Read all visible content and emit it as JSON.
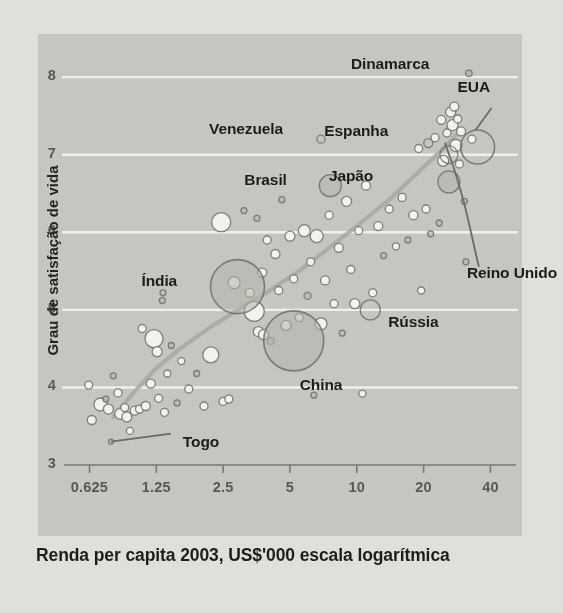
{
  "chart_data": {
    "type": "scatter",
    "title": "",
    "xlabel": "Renda per capita 2003, US$'000 escala logarítmica",
    "ylabel": "Grau de satisfação de vida",
    "xscale": "log",
    "xlim": [
      0.5,
      48
    ],
    "ylim": [
      3,
      8.35
    ],
    "xticks": [
      0.625,
      1.25,
      2.5,
      5,
      10,
      20,
      40
    ],
    "xticklabels": [
      "0.625",
      "1.25",
      "2.5",
      "5",
      "10",
      "20",
      "40"
    ],
    "yticks": [
      3,
      4,
      5,
      6,
      7,
      8
    ],
    "yticklabels": [
      "3",
      "4",
      "5",
      "6",
      "7",
      "8"
    ],
    "grid": "horizontal",
    "legend": "none",
    "bubble_note": "marker area scales with population",
    "colors": {
      "panel_background": "#c8c8c2",
      "figure_background": "#e2e2dc",
      "gridline": "#f2f2ee",
      "marker_edge": "#6f6f69",
      "marker_fill_light": "#f4f4f0",
      "marker_fill_dark": "#b4b4ad",
      "trend_line": "#a8a8a1",
      "leader_line": "#6b6b65",
      "axis_text": "#585854",
      "label_text": "#1c1c19"
    },
    "annotations": [
      {
        "label": "Dinamarca",
        "x": 32,
        "y": 8.05,
        "r": 3.2,
        "fill": "dark",
        "label_dx": -118,
        "label_dy": -9
      },
      {
        "label": "EUA",
        "x": 35,
        "y": 7.1,
        "r": 17,
        "fill": "none",
        "label_dx": -20,
        "label_dy": -60,
        "leader": true
      },
      {
        "label": "Espanha",
        "x": 21,
        "y": 7.15,
        "r": 4.5,
        "fill": "none",
        "label_dx": -104,
        "label_dy": -12
      },
      {
        "label": "Venezuela",
        "x": 6.9,
        "y": 7.2,
        "r": 4,
        "fill": "none",
        "label_dx": -112,
        "label_dy": -10
      },
      {
        "label": "Brasil",
        "x": 7.6,
        "y": 6.6,
        "r": 11,
        "fill": "dark",
        "label_dx": -86,
        "label_dy": -6
      },
      {
        "label": "Japão",
        "x": 26,
        "y": 6.65,
        "r": 11,
        "fill": "dark",
        "label_dx": -120,
        "label_dy": -6
      },
      {
        "label": "Índia",
        "x": 2.9,
        "y": 5.3,
        "r": 27,
        "fill": "dark",
        "label_dx": -96,
        "label_dy": -6
      },
      {
        "label": "Reino Unido",
        "x": 26,
        "y": 7.0,
        "r": 9,
        "fill": "none",
        "label_dx": 18,
        "label_dy": 118,
        "leader": true
      },
      {
        "label": "Rússia",
        "x": 11.5,
        "y": 5.0,
        "r": 10,
        "fill": "none",
        "label_dx": 18,
        "label_dy": 12
      },
      {
        "label": "China",
        "x": 5.2,
        "y": 4.6,
        "r": 30,
        "fill": "dark",
        "label_dx": 6,
        "label_dy": 44
      },
      {
        "label": "Togo",
        "x": 0.78,
        "y": 3.3,
        "r": 2.5,
        "fill": "dark",
        "label_dx": 72,
        "label_dy": 0,
        "leader": true
      }
    ],
    "points": [
      {
        "x": 0.62,
        "y": 4.03,
        "r": 4.0,
        "fill": "light"
      },
      {
        "x": 0.64,
        "y": 3.58,
        "r": 4.5,
        "fill": "light"
      },
      {
        "x": 0.7,
        "y": 3.78,
        "r": 6.5,
        "fill": "light"
      },
      {
        "x": 0.74,
        "y": 3.85,
        "r": 3.0,
        "fill": "dark"
      },
      {
        "x": 0.76,
        "y": 3.72,
        "r": 5.0,
        "fill": "light"
      },
      {
        "x": 0.8,
        "y": 4.15,
        "r": 3.0,
        "fill": "dark"
      },
      {
        "x": 0.84,
        "y": 3.93,
        "r": 4.0,
        "fill": "light"
      },
      {
        "x": 0.86,
        "y": 3.66,
        "r": 5.5,
        "fill": "light"
      },
      {
        "x": 0.9,
        "y": 3.74,
        "r": 4.0,
        "fill": "light"
      },
      {
        "x": 0.92,
        "y": 3.62,
        "r": 5.0,
        "fill": "light"
      },
      {
        "x": 0.95,
        "y": 3.44,
        "r": 3.5,
        "fill": "light"
      },
      {
        "x": 1.0,
        "y": 3.7,
        "r": 4.5,
        "fill": "light"
      },
      {
        "x": 1.05,
        "y": 3.72,
        "r": 4.0,
        "fill": "light"
      },
      {
        "x": 1.08,
        "y": 4.76,
        "r": 4.0,
        "fill": "light"
      },
      {
        "x": 1.12,
        "y": 3.76,
        "r": 4.5,
        "fill": "light"
      },
      {
        "x": 1.18,
        "y": 4.05,
        "r": 4.5,
        "fill": "light"
      },
      {
        "x": 1.22,
        "y": 4.63,
        "r": 9.0,
        "fill": "light"
      },
      {
        "x": 1.26,
        "y": 4.46,
        "r": 5.0,
        "fill": "light"
      },
      {
        "x": 1.28,
        "y": 3.86,
        "r": 4.0,
        "fill": "light"
      },
      {
        "x": 1.33,
        "y": 5.12,
        "r": 3.0,
        "fill": "dark"
      },
      {
        "x": 1.34,
        "y": 5.22,
        "r": 3.0,
        "fill": "dark"
      },
      {
        "x": 1.36,
        "y": 3.68,
        "r": 4.0,
        "fill": "light"
      },
      {
        "x": 1.4,
        "y": 4.18,
        "r": 3.5,
        "fill": "light"
      },
      {
        "x": 1.46,
        "y": 4.54,
        "r": 3.0,
        "fill": "dark"
      },
      {
        "x": 1.55,
        "y": 3.8,
        "r": 3.0,
        "fill": "dark"
      },
      {
        "x": 1.62,
        "y": 4.34,
        "r": 3.5,
        "fill": "light"
      },
      {
        "x": 1.75,
        "y": 3.98,
        "r": 4.0,
        "fill": "light"
      },
      {
        "x": 1.9,
        "y": 4.18,
        "r": 3.0,
        "fill": "dark"
      },
      {
        "x": 2.05,
        "y": 3.76,
        "r": 4.0,
        "fill": "light"
      },
      {
        "x": 2.2,
        "y": 4.42,
        "r": 8.0,
        "fill": "light"
      },
      {
        "x": 2.45,
        "y": 6.13,
        "r": 9.5,
        "fill": "light"
      },
      {
        "x": 2.5,
        "y": 3.82,
        "r": 4.0,
        "fill": "light"
      },
      {
        "x": 2.65,
        "y": 3.85,
        "r": 4.0,
        "fill": "light"
      },
      {
        "x": 2.8,
        "y": 5.35,
        "r": 6.0,
        "fill": "light"
      },
      {
        "x": 3.1,
        "y": 6.28,
        "r": 3.0,
        "fill": "dark"
      },
      {
        "x": 3.3,
        "y": 5.22,
        "r": 4.5,
        "fill": "light"
      },
      {
        "x": 3.45,
        "y": 4.98,
        "r": 10.0,
        "fill": "light"
      },
      {
        "x": 3.55,
        "y": 6.18,
        "r": 3.0,
        "fill": "dark"
      },
      {
        "x": 3.6,
        "y": 4.72,
        "r": 5.0,
        "fill": "light"
      },
      {
        "x": 3.75,
        "y": 5.48,
        "r": 4.5,
        "fill": "light"
      },
      {
        "x": 3.8,
        "y": 4.68,
        "r": 5.0,
        "fill": "light"
      },
      {
        "x": 3.95,
        "y": 5.9,
        "r": 4.0,
        "fill": "light"
      },
      {
        "x": 4.1,
        "y": 4.6,
        "r": 3.5,
        "fill": "dark"
      },
      {
        "x": 4.3,
        "y": 5.72,
        "r": 4.5,
        "fill": "light"
      },
      {
        "x": 4.45,
        "y": 5.25,
        "r": 4.0,
        "fill": "light"
      },
      {
        "x": 4.6,
        "y": 6.42,
        "r": 3.0,
        "fill": "dark"
      },
      {
        "x": 4.8,
        "y": 4.8,
        "r": 5.0,
        "fill": "light"
      },
      {
        "x": 5.0,
        "y": 5.95,
        "r": 5.0,
        "fill": "light"
      },
      {
        "x": 5.2,
        "y": 5.4,
        "r": 4.0,
        "fill": "light"
      },
      {
        "x": 5.5,
        "y": 4.9,
        "r": 4.0,
        "fill": "light"
      },
      {
        "x": 5.8,
        "y": 6.02,
        "r": 6.0,
        "fill": "light"
      },
      {
        "x": 6.0,
        "y": 5.18,
        "r": 3.5,
        "fill": "dark"
      },
      {
        "x": 6.2,
        "y": 5.62,
        "r": 4.0,
        "fill": "light"
      },
      {
        "x": 6.4,
        "y": 3.9,
        "r": 3.0,
        "fill": "dark"
      },
      {
        "x": 6.6,
        "y": 5.95,
        "r": 6.5,
        "fill": "light"
      },
      {
        "x": 6.9,
        "y": 4.82,
        "r": 6.0,
        "fill": "light"
      },
      {
        "x": 7.2,
        "y": 5.38,
        "r": 4.5,
        "fill": "light"
      },
      {
        "x": 7.5,
        "y": 6.22,
        "r": 4.0,
        "fill": "light"
      },
      {
        "x": 7.9,
        "y": 5.08,
        "r": 4.0,
        "fill": "light"
      },
      {
        "x": 8.3,
        "y": 5.8,
        "r": 4.5,
        "fill": "light"
      },
      {
        "x": 8.6,
        "y": 4.7,
        "r": 3.0,
        "fill": "dark"
      },
      {
        "x": 9.0,
        "y": 6.4,
        "r": 5.0,
        "fill": "light"
      },
      {
        "x": 9.4,
        "y": 5.52,
        "r": 4.0,
        "fill": "light"
      },
      {
        "x": 9.8,
        "y": 5.08,
        "r": 5.0,
        "fill": "light"
      },
      {
        "x": 10.2,
        "y": 6.02,
        "r": 4.0,
        "fill": "light"
      },
      {
        "x": 10.6,
        "y": 3.92,
        "r": 3.5,
        "fill": "light"
      },
      {
        "x": 11.0,
        "y": 6.6,
        "r": 4.5,
        "fill": "light"
      },
      {
        "x": 11.8,
        "y": 5.22,
        "r": 4.0,
        "fill": "light"
      },
      {
        "x": 12.5,
        "y": 6.08,
        "r": 4.5,
        "fill": "light"
      },
      {
        "x": 13.2,
        "y": 5.7,
        "r": 3.0,
        "fill": "dark"
      },
      {
        "x": 14.0,
        "y": 6.3,
        "r": 4.0,
        "fill": "light"
      },
      {
        "x": 15.0,
        "y": 5.82,
        "r": 3.5,
        "fill": "light"
      },
      {
        "x": 16.0,
        "y": 6.45,
        "r": 4.0,
        "fill": "light"
      },
      {
        "x": 17.0,
        "y": 5.9,
        "r": 3.0,
        "fill": "dark"
      },
      {
        "x": 18.0,
        "y": 6.22,
        "r": 4.5,
        "fill": "light"
      },
      {
        "x": 19.0,
        "y": 7.08,
        "r": 4.0,
        "fill": "light"
      },
      {
        "x": 19.5,
        "y": 5.25,
        "r": 3.5,
        "fill": "light"
      },
      {
        "x": 20.5,
        "y": 6.3,
        "r": 4.0,
        "fill": "light"
      },
      {
        "x": 21.5,
        "y": 5.98,
        "r": 3.0,
        "fill": "dark"
      },
      {
        "x": 22.5,
        "y": 7.22,
        "r": 4.0,
        "fill": "light"
      },
      {
        "x": 23.5,
        "y": 6.12,
        "r": 3.0,
        "fill": "dark"
      },
      {
        "x": 24.0,
        "y": 7.45,
        "r": 4.5,
        "fill": "light"
      },
      {
        "x": 24.5,
        "y": 6.92,
        "r": 5.5,
        "fill": "light"
      },
      {
        "x": 25.5,
        "y": 7.28,
        "r": 4.0,
        "fill": "light"
      },
      {
        "x": 26.5,
        "y": 7.55,
        "r": 5.0,
        "fill": "light"
      },
      {
        "x": 27.0,
        "y": 7.38,
        "r": 5.5,
        "fill": "light"
      },
      {
        "x": 27.5,
        "y": 7.62,
        "r": 4.5,
        "fill": "light"
      },
      {
        "x": 28.0,
        "y": 7.12,
        "r": 6.0,
        "fill": "light"
      },
      {
        "x": 28.5,
        "y": 7.46,
        "r": 4.0,
        "fill": "light"
      },
      {
        "x": 29.0,
        "y": 6.88,
        "r": 4.0,
        "fill": "light"
      },
      {
        "x": 29.5,
        "y": 7.3,
        "r": 4.5,
        "fill": "light"
      },
      {
        "x": 30.5,
        "y": 6.4,
        "r": 3.0,
        "fill": "dark"
      },
      {
        "x": 31.0,
        "y": 5.62,
        "r": 3.0,
        "fill": "dark"
      },
      {
        "x": 33.0,
        "y": 7.2,
        "r": 4.0,
        "fill": "light"
      }
    ],
    "trend": [
      [
        0.8,
        3.62
      ],
      [
        1.0,
        3.95
      ],
      [
        1.25,
        4.25
      ],
      [
        1.6,
        4.5
      ],
      [
        2.2,
        4.78
      ],
      [
        3.0,
        5.02
      ],
      [
        4.0,
        5.24
      ],
      [
        5.5,
        5.5
      ],
      [
        7.5,
        5.8
      ],
      [
        10.0,
        6.08
      ],
      [
        14.0,
        6.42
      ],
      [
        19.0,
        6.78
      ],
      [
        24.0,
        7.05
      ],
      [
        28.0,
        7.25
      ]
    ]
  }
}
